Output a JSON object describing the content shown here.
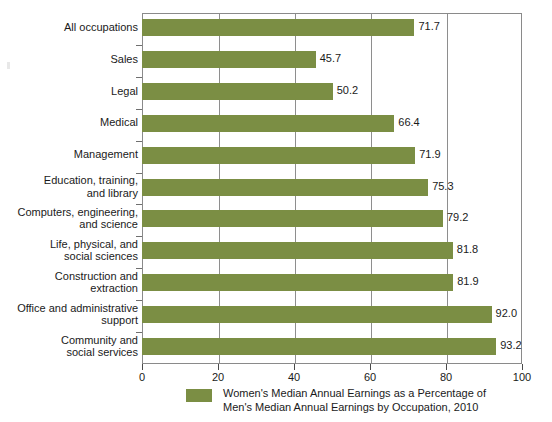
{
  "chart_data": {
    "type": "bar",
    "orientation": "horizontal",
    "title": "",
    "xlabel": "",
    "ylabel": "",
    "xlim": [
      0,
      100
    ],
    "xticks": [
      0,
      20,
      40,
      60,
      80,
      100
    ],
    "grid": true,
    "grid_axis": "x",
    "legend_position": "bottom",
    "series_color": "#7b8e44",
    "categories": [
      "All occupations",
      "Sales",
      "Legal",
      "Medical",
      "Management",
      "Education, training,\nand library",
      "Computers, engineering,\nand science",
      "Life, physical, and\nsocial sciences",
      "Construction and\nextraction",
      "Office and administrative\nsupport",
      "Community and\nsocial services"
    ],
    "values": [
      71.7,
      45.7,
      50.2,
      66.4,
      71.9,
      75.3,
      79.2,
      81.8,
      81.9,
      92.0,
      93.2
    ],
    "value_labels": [
      "71.7",
      "45.7",
      "50.2",
      "66.4",
      "71.9",
      "75.3",
      "79.2",
      "81.8",
      "81.9",
      "92.0",
      "93.2"
    ],
    "legend": [
      {
        "label": "Women's Median Annual Earnings as a Percentage of\nMen's Median Annual Earnings by Occupation, 2010",
        "color": "#7b8e44"
      }
    ]
  },
  "axis": {
    "tick_labels": [
      "0",
      "20",
      "40",
      "60",
      "80",
      "100"
    ]
  },
  "colors": {
    "bar": "#7b8e44",
    "frame": "#8a8a8a",
    "gridline": "#8e8e8e",
    "text": "#1a1a1a"
  }
}
